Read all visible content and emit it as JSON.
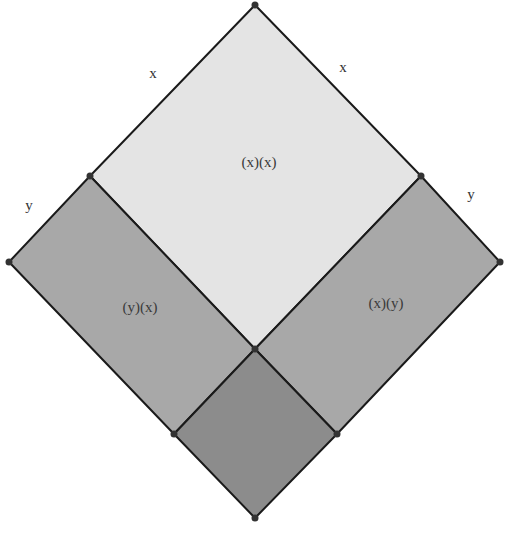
{
  "diagram": {
    "type": "geometric-area-model",
    "colors": {
      "background": "#ffffff",
      "stroke": "#1a1a1a",
      "vertex": "#333333",
      "square_xx": "#e4e4e4",
      "rect_yx": "#a8a8a8",
      "rect_xy": "#a8a8a8",
      "square_yy": "#8c8c8c"
    },
    "side_labels": [
      {
        "id": "top-left-x",
        "text": "x",
        "x": 153,
        "y": 78
      },
      {
        "id": "top-right-x",
        "text": "x",
        "x": 343,
        "y": 72
      },
      {
        "id": "left-y",
        "text": "y",
        "x": 29,
        "y": 210
      },
      {
        "id": "right-y",
        "text": "y",
        "x": 471,
        "y": 199
      }
    ],
    "regions": [
      {
        "id": "square-xx",
        "label": "(x)(x)",
        "label_x": 259,
        "label_y": 167,
        "points": "255,5 421,176 255,349 90,176"
      },
      {
        "id": "rect-yx",
        "label": "(y)(x)",
        "label_x": 140,
        "label_y": 312,
        "points": "90,176 255,349 174,434 9,262"
      },
      {
        "id": "rect-xy",
        "label": "(x)(y)",
        "label_x": 386,
        "label_y": 308,
        "points": "421,176 500,262 337,434 255,349"
      },
      {
        "id": "square-yy",
        "label": "",
        "label_x": 255,
        "label_y": 434,
        "points": "255,349 337,434 255,518 174,434"
      }
    ],
    "vertices": [
      {
        "id": "top",
        "x": 255,
        "y": 5
      },
      {
        "id": "upper-left",
        "x": 90,
        "y": 176
      },
      {
        "id": "upper-right",
        "x": 421,
        "y": 176
      },
      {
        "id": "left",
        "x": 9,
        "y": 262
      },
      {
        "id": "right",
        "x": 500,
        "y": 262
      },
      {
        "id": "center",
        "x": 255,
        "y": 349
      },
      {
        "id": "lower-left",
        "x": 174,
        "y": 434
      },
      {
        "id": "lower-right",
        "x": 337,
        "y": 434
      },
      {
        "id": "bottom",
        "x": 255,
        "y": 518
      }
    ]
  }
}
